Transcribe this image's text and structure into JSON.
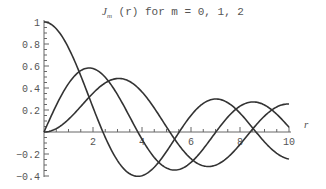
{
  "chart_data": {
    "type": "line",
    "title_main": "J",
    "title_sub": "m",
    "title_rest": " (r) for m = 0, 1, 2",
    "xlabel": "r",
    "ylabel": "",
    "xlim": [
      0,
      10
    ],
    "ylim": [
      -0.4,
      1.0
    ],
    "x_ticks": [
      2,
      4,
      6,
      8,
      10
    ],
    "x_tick_labels": [
      "2",
      "4",
      "6",
      "8",
      "10"
    ],
    "y_ticks": [
      -0.4,
      -0.2,
      0.2,
      0.4,
      0.6,
      0.8,
      1
    ],
    "y_tick_labels": [
      "-0.4",
      "-0.2",
      "0.2",
      "0.4",
      "0.6",
      "0.8",
      "1"
    ],
    "grid": false,
    "legend": "none",
    "x": [
      0,
      0.5,
      1,
      1.5,
      2,
      2.5,
      3,
      3.5,
      4,
      4.5,
      5,
      5.5,
      6,
      6.5,
      7,
      7.5,
      8,
      8.5,
      9,
      9.5,
      10
    ],
    "series": [
      {
        "name": "J0(r)",
        "values": [
          1.0,
          0.938,
          0.765,
          0.512,
          0.224,
          -0.048,
          -0.26,
          -0.38,
          -0.397,
          -0.321,
          -0.178,
          -0.007,
          0.151,
          0.26,
          0.3,
          0.271,
          0.172,
          0.042,
          -0.09,
          -0.194,
          -0.246
        ]
      },
      {
        "name": "J1(r)",
        "values": [
          0.0,
          0.242,
          0.44,
          0.558,
          0.577,
          0.497,
          0.339,
          0.137,
          -0.066,
          -0.231,
          -0.328,
          -0.341,
          -0.277,
          -0.154,
          -0.005,
          0.135,
          0.235,
          0.273,
          0.245,
          0.161,
          0.043
        ]
      },
      {
        "name": "J2(r)",
        "values": [
          0.0,
          0.031,
          0.115,
          0.232,
          0.353,
          0.446,
          0.486,
          0.459,
          0.364,
          0.217,
          0.047,
          -0.117,
          -0.243,
          -0.307,
          -0.301,
          -0.23,
          -0.113,
          0.022,
          0.145,
          0.228,
          0.255
        ]
      }
    ],
    "line_color": "#333333"
  }
}
